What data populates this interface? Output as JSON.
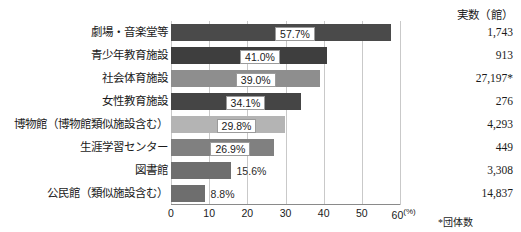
{
  "header": {
    "value_column_title": "実数（館）"
  },
  "axis": {
    "ticks": [
      "0",
      "10",
      "20",
      "30",
      "40",
      "50",
      "60"
    ],
    "unit_suffix": "(%)",
    "min": 0,
    "max": 60
  },
  "footnote": "*団体数",
  "chart_data": {
    "type": "bar",
    "orientation": "horizontal",
    "title": "",
    "xlabel": "(%)",
    "ylabel": "",
    "xlim": [
      0,
      60
    ],
    "grid": true,
    "legend": "none",
    "categories": [
      "劇場・音楽堂等",
      "青少年教育施設",
      "社会体育施設",
      "女性教育施設",
      "博物館（博物館類似施設含む）",
      "生涯学習センター",
      "図書館",
      "公民館（類似施設含む）"
    ],
    "values": [
      57.7,
      41.0,
      39.0,
      34.1,
      29.8,
      26.9,
      15.6,
      8.8
    ],
    "value_labels": [
      "57.7%",
      "41.0%",
      "39.0%",
      "34.1%",
      "29.8%",
      "26.9%",
      "15.6%",
      "8.8%"
    ],
    "label_placement": [
      "inside",
      "inside",
      "inside",
      "inside",
      "inside",
      "inside",
      "outside",
      "outside"
    ],
    "bar_colors": [
      "#4a4a4a",
      "#3e3e3e",
      "#8e8e8e",
      "#454545",
      "#b4b4b4",
      "#808080",
      "#6e6e6e",
      "#6e6e6e"
    ],
    "counts": [
      "1,743",
      "913",
      "27,197*",
      "276",
      "4,293",
      "449",
      "3,308",
      "14,837"
    ],
    "counts_header": "実数（館）"
  }
}
